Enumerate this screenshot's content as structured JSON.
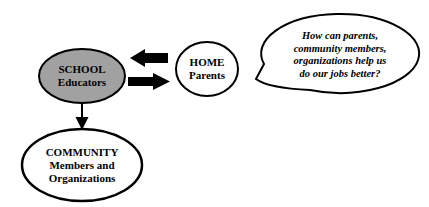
{
  "diagram": {
    "nodes": {
      "school": {
        "lines": [
          "SCHOOL",
          "Educators"
        ],
        "fill": "#a1a1a1"
      },
      "home": {
        "lines": [
          "HOME",
          "Parents"
        ],
        "fill": "#ffffff"
      },
      "community": {
        "lines": [
          "COMMUNITY",
          "Members and",
          "Organizations"
        ],
        "fill": "#ffffff"
      }
    },
    "speech_bubble": {
      "lines": [
        "How can parents,",
        "community members,",
        "organizations help us",
        "do our jobs better?"
      ],
      "fill": "#ffffff"
    },
    "colors": {
      "stroke": "#000000",
      "arrow": "#000000",
      "background": "#ffffff"
    }
  }
}
